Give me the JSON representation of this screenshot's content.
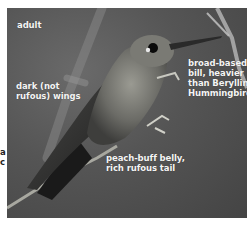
{
  "figure": {
    "age_label": "adult",
    "annotations": {
      "wings": "dark (not rufous) wings",
      "wings_line1": "dark (not",
      "wings_line2": "rufous) wings",
      "bill_line1": "broad-based",
      "bill_line2": "bill, heavier",
      "bill_line3": "than Berylline",
      "bill_line4": "Hummingbird",
      "belly_line1": "peach-buff belly,",
      "belly_line2": "rich rufous tail"
    },
    "edge_fragments": [
      "a",
      "c"
    ],
    "colors": {
      "background": "#ffffff",
      "photo_bg": "#555555",
      "label_text": "#f4f4f4"
    }
  }
}
